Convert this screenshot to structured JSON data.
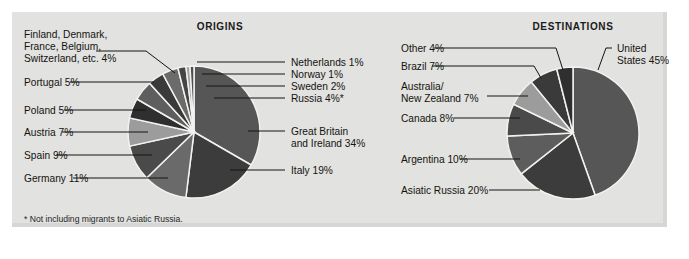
{
  "figure": {
    "background_color": "#e2e2e0",
    "page_color": "#ffffff",
    "footnote": "* Not including migrants to Asiatic Russia."
  },
  "palette": {
    "dark": "#333333",
    "mid_dark": "#414141",
    "mid": "#565656",
    "mid_light": "#6e6e6e",
    "light": "#9a9a9a",
    "very_light": "#c4c4c4",
    "separator": "#f2f2f0",
    "text": "#14140f"
  },
  "chart_data": [
    {
      "type": "pie",
      "title": "ORIGINS",
      "id": "origins",
      "xlabel": "",
      "ylabel": "",
      "legend": "callout labels with leader lines",
      "labels": [
        "Great Britain and Ireland 34%",
        "Italy 19%",
        "Germany 11%",
        "Spain 9%",
        "Austria 7%",
        "Poland 5%",
        "Portugal 5%",
        "Finland, Denmark, France, Belgium, Switzerland, etc. 4%",
        "Russia 4%*",
        "Sweden 2%",
        "Norway 1%",
        "Netherlands 1%"
      ],
      "categories": [
        "Great Britain and Ireland",
        "Italy",
        "Germany",
        "Spain",
        "Austria",
        "Poland",
        "Portugal",
        "Finland, Denmark, France, Belgium, Switzerland, etc.",
        "Russia",
        "Sweden",
        "Norway",
        "Netherlands"
      ],
      "values": [
        34,
        19,
        11,
        9,
        7,
        5,
        5,
        4,
        4,
        2,
        1,
        1
      ],
      "slices": [
        {
          "name": "Great Britain and Ireland",
          "label": "Great Britain",
          "label2": "and Ireland  34%",
          "value": 34,
          "pct": "34%",
          "color": "#565656"
        },
        {
          "name": "Italy",
          "label": "Italy  19%",
          "value": 19,
          "pct": "19%",
          "color": "#3c3c3c"
        },
        {
          "name": "Germany",
          "label": "Germany  11%",
          "value": 11,
          "pct": "11%",
          "color": "#6a6a6a"
        },
        {
          "name": "Spain",
          "label": "Spain  9%",
          "value": 9,
          "pct": "9%",
          "color": "#4a4a4a"
        },
        {
          "name": "Austria",
          "label": "Austria  7%",
          "value": 7,
          "pct": "7%",
          "color": "#9c9c9c"
        },
        {
          "name": "Poland",
          "label": "Poland  5%",
          "value": 5,
          "pct": "5%",
          "color": "#2f2f2f"
        },
        {
          "name": "Portugal",
          "label": "Portugal  5%",
          "value": 5,
          "pct": "5%",
          "color": "#5e5e5e"
        },
        {
          "name": "Finland, Denmark, France, Belgium, Switzerland, etc.",
          "label": "Finland, Denmark,",
          "label2": "France, Belgium,",
          "label3": "Switzerland, etc.  4%",
          "value": 4,
          "pct": "4%",
          "color": "#3a3a3a"
        },
        {
          "name": "Russia",
          "label": "Russia  4%*",
          "value": 4,
          "pct": "4%*",
          "color": "#6b6b6b"
        },
        {
          "name": "Sweden",
          "label": "Sweden  2%",
          "value": 2,
          "pct": "2%",
          "color": "#454545"
        },
        {
          "name": "Norway",
          "label": "Norway  1%",
          "value": 1,
          "pct": "1%",
          "color": "#9f9f9f"
        },
        {
          "name": "Netherlands",
          "label": "Netherlands  1%",
          "value": 1,
          "pct": "1%",
          "color": "#4f4f4f"
        }
      ]
    },
    {
      "type": "pie",
      "title": "DESTINATIONS",
      "id": "destinations",
      "xlabel": "",
      "ylabel": "",
      "legend": "callout labels with leader lines",
      "labels": [
        "United States 45%",
        "Asiatic Russia 20%",
        "Argentina 10%",
        "Canada 8%",
        "Australia/New Zealand 7%",
        "Brazil 7%",
        "Other 4%"
      ],
      "categories": [
        "United States",
        "Asiatic Russia",
        "Argentina",
        "Canada",
        "Australia/New Zealand",
        "Brazil",
        "Other"
      ],
      "values": [
        45,
        20,
        10,
        8,
        7,
        7,
        4
      ],
      "slices": [
        {
          "name": "United States",
          "label": "United",
          "label2": "States 45%",
          "value": 45,
          "pct": "45%",
          "color": "#565656"
        },
        {
          "name": "Asiatic Russia",
          "label": "Asiatic Russia  20%",
          "value": 20,
          "pct": "20%",
          "color": "#3c3c3c"
        },
        {
          "name": "Argentina",
          "label": "Argentina  10%",
          "value": 10,
          "pct": "10%",
          "color": "#5d5d5d"
        },
        {
          "name": "Canada",
          "label": "Canada  8%",
          "value": 8,
          "pct": "8%",
          "color": "#4a4a4a"
        },
        {
          "name": "Australia/New Zealand",
          "label": "Australia/",
          "label2": "New Zealand  7%",
          "value": 7,
          "pct": "7%",
          "color": "#9c9c9c"
        },
        {
          "name": "Brazil",
          "label": "Brazil  7%",
          "value": 7,
          "pct": "7%",
          "color": "#3a3a3a"
        },
        {
          "name": "Other",
          "label": "Other  4%",
          "value": 4,
          "pct": "4%",
          "color": "#2f2f2f"
        }
      ]
    }
  ]
}
